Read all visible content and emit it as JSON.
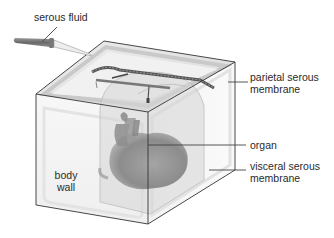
{
  "figure": {
    "type": "anatomical-diagram"
  },
  "labels": {
    "serous_fluid": "serous fluid",
    "parietal_line1": "parietal serous",
    "parietal_line2": "membrane",
    "organ": "organ",
    "visceral_line1": "visceral serous",
    "visceral_line2": "membrane",
    "body_line1": "body",
    "body_line2": "wall"
  },
  "colors": {
    "background": "#ffffff",
    "box_edge": "#333333",
    "box_fill": "#f2f2f2",
    "top_face": "#e6e6e6",
    "membrane_band": "#cfcfcf",
    "sac_fill": "#d9d9d9",
    "organ": "#8a8a8a",
    "leader_line": "#444444",
    "text": "#2a2a2a"
  }
}
